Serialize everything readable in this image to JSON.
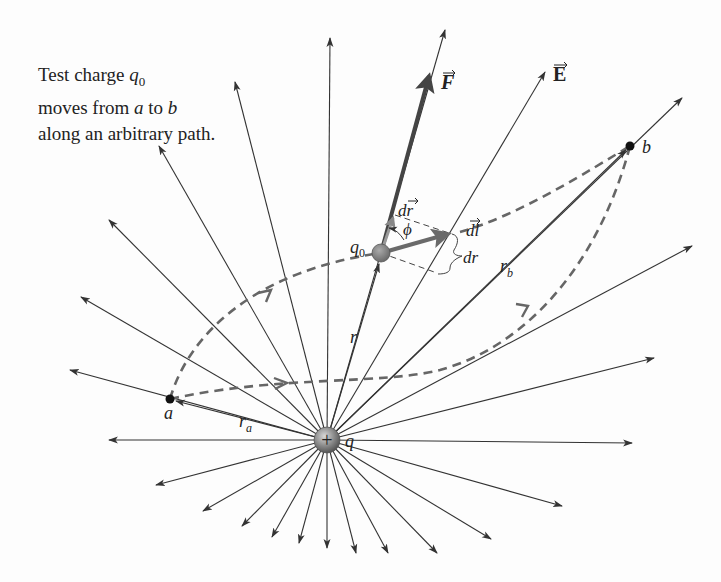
{
  "caption": {
    "line1_prefix": "Test charge ",
    "line1_var": "q",
    "line1_sub": "0",
    "line2_prefix": "moves from ",
    "line2_a": "a",
    "line2_mid": " to ",
    "line2_b": "b",
    "line3": "along an arbitrary path."
  },
  "labels": {
    "force": "F",
    "field": "E",
    "dr_vec": "dr",
    "dl_vec": "dl",
    "phi": "ϕ",
    "dr_scalar": "dr",
    "q0": "q",
    "q0_sub": "0",
    "r": "r",
    "rb": "r",
    "rb_sub": "b",
    "ra": "r",
    "ra_sub": "a",
    "point_a": "a",
    "point_b": "b",
    "source_charge": "q",
    "plus_sign": "+"
  },
  "colors": {
    "field_line": "#333333",
    "force_vector": "#444444",
    "dl_vector": "#666666",
    "path_dashed": "#666666",
    "charge_fill": "#888888",
    "background": "#fdfdfd"
  },
  "geometry": {
    "source_center": [
      327,
      440
    ],
    "test_charge": [
      381,
      253
    ],
    "point_a": [
      170,
      399
    ],
    "point_b": [
      630,
      146
    ]
  }
}
